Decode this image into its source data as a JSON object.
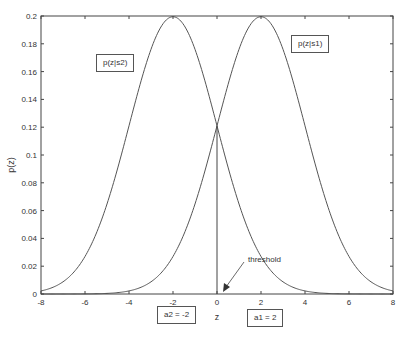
{
  "chart_data": {
    "type": "line",
    "title": "",
    "xlabel": "z",
    "ylabel": "p(z)",
    "xlim": [
      -8,
      8
    ],
    "ylim": [
      0,
      0.2
    ],
    "grid": false,
    "xticks": [
      -8,
      -6,
      -4,
      -2,
      0,
      2,
      4,
      6,
      8
    ],
    "yticks": [
      0,
      0.02,
      0.04,
      0.06,
      0.08,
      0.1,
      0.12,
      0.14,
      0.16,
      0.18,
      0.2
    ],
    "xtick_labels": [
      "-8",
      "-6",
      "-4",
      "-2",
      "0",
      "2",
      "4",
      "6",
      "8"
    ],
    "ytick_labels": [
      "0",
      "0.02",
      "0.04",
      "0.06",
      "0.08",
      "0.1",
      "0.12",
      "0.14",
      "0.16",
      "0.18",
      "0.2"
    ],
    "series": [
      {
        "name": "p(z|s2)",
        "distribution": "gaussian",
        "mean": -2,
        "std": 2,
        "peak": 0.1995
      },
      {
        "name": "p(z|s1)",
        "distribution": "gaussian",
        "mean": 2,
        "std": 2,
        "peak": 0.1995
      }
    ],
    "vertical_line": {
      "x": 0,
      "label": "threshold",
      "y_top": 0.121
    },
    "annotations": [
      {
        "text": "p(z|s2)",
        "type": "box"
      },
      {
        "text": "p(z|s1)",
        "type": "box"
      },
      {
        "text": "threshold",
        "type": "arrow-label"
      },
      {
        "text": "a2 = -2",
        "type": "box"
      },
      {
        "text": "a1 = 2",
        "type": "box"
      }
    ]
  },
  "labels": {
    "s2": "p(z|s2)",
    "s1": "p(z|s1)",
    "threshold": "threshold",
    "a2": "a2 = -2",
    "a1": "a1 = 2",
    "xlabel": "z",
    "ylabel": "p(z)"
  },
  "colors": {
    "curve": "#555555",
    "axis": "#444444",
    "text": "#333333"
  }
}
